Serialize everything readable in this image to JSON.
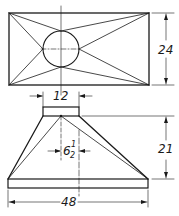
{
  "drawing": {
    "type": "hopper-transition-piece",
    "views": [
      "top-view",
      "front-view"
    ],
    "stroke_color": "#1a1a1a",
    "background": "#ffffff"
  },
  "dimensions": {
    "top_view_height": "24",
    "neck_width": "12",
    "offset_whole": "6",
    "offset_num": "1",
    "offset_den": "2",
    "front_height": "21",
    "base_width": "48"
  }
}
